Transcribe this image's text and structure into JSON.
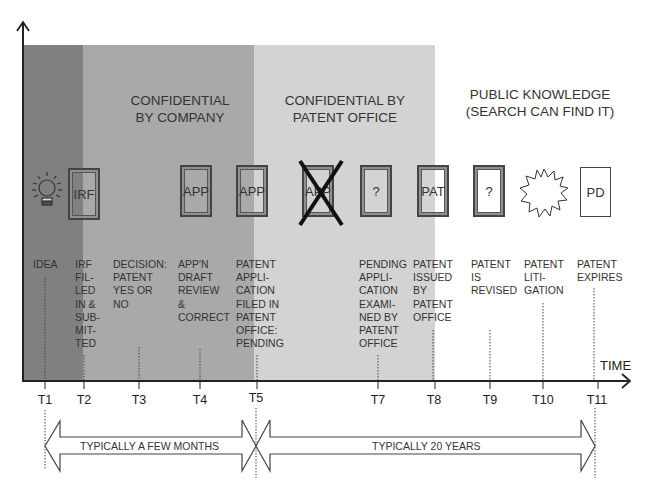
{
  "zones": [
    {
      "id": "idea",
      "color": "#7f7f7f",
      "x_start": 23,
      "x_end": 83,
      "title": ""
    },
    {
      "id": "company",
      "color": "#a8a8a8",
      "x_start": 83,
      "x_end": 254,
      "title_lines": [
        "CONFIDENTIAL",
        "BY COMPANY"
      ]
    },
    {
      "id": "patent_office",
      "color": "#d4d4d4",
      "x_start": 254,
      "x_end": 435,
      "title_lines": [
        "CONFIDENTIAL BY",
        "PATENT OFFICE"
      ]
    },
    {
      "id": "public",
      "color": "#ffffff",
      "x_start": 435,
      "x_end": 630,
      "title_lines": [
        "PUBLIC KNOWLEDGE",
        "(SEARCH CAN FIND IT)"
      ]
    }
  ],
  "documents": [
    {
      "icon": "lightbulb-icon",
      "label": ""
    },
    {
      "icon": "document-icon",
      "label": "IRF"
    },
    {
      "icon": "document-icon",
      "label": "APP"
    },
    {
      "icon": "document-icon",
      "label": "APP"
    },
    {
      "icon": "crossed-out-document-icon",
      "label": "APP"
    },
    {
      "icon": "document-icon",
      "label": "?"
    },
    {
      "icon": "document-icon",
      "label": "PAT"
    },
    {
      "icon": "document-icon",
      "label": "?"
    },
    {
      "icon": "starburst-icon",
      "label": ""
    },
    {
      "icon": "plain-document-icon",
      "label": "PD"
    }
  ],
  "events": [
    {
      "tick": "T1",
      "text": "IDEA"
    },
    {
      "tick": "T2",
      "text": "IRF\nFIL-\nLED\nIN &\nSUB-\nMIT-\nTED"
    },
    {
      "tick": "T3",
      "text": "DECISION:\nPATENT\nYES OR\nNO"
    },
    {
      "tick": "T4",
      "text": "APP'N\nDRAFT\nREVIEW\n&\nCORRECT"
    },
    {
      "tick": "T5",
      "text": "PATENT\nAPPLI-\nCATION\nFILED IN\nPATENT\nOFFICE:\nPENDING"
    },
    {
      "tick": "T7",
      "text": "PENDING\nAPPLI-\nCATION\nEXAMI-\nNED BY\nPATENT\nOFFICE"
    },
    {
      "tick": "T8",
      "text": "PATENT\nISSUED\nBY\nPATENT\nOFFICE"
    },
    {
      "tick": "T9",
      "text": "PATENT\nIS\nREVISED"
    },
    {
      "tick": "T10",
      "text": "PATENT\nLITI-\nGATION"
    },
    {
      "tick": "T11",
      "text": "PATENT\nEXPIRES"
    }
  ],
  "axis": {
    "x_label": "TIME",
    "ticks": [
      "T1",
      "T2",
      "T3",
      "T4",
      "T5",
      "T7",
      "T8",
      "T9",
      "T10",
      "T11"
    ]
  },
  "spans": [
    {
      "from": "T1",
      "to": "T5",
      "label": "TYPICALLY A FEW MONTHS",
      "direction": "left"
    },
    {
      "from": "T5",
      "to": "T11",
      "label": "TYPICALLY 20 YEARS",
      "direction": "right"
    }
  ]
}
